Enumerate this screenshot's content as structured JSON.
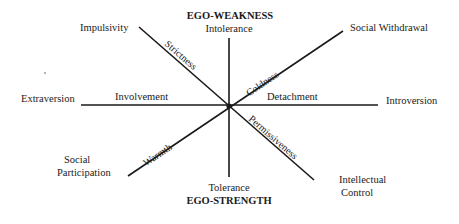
{
  "diagram": {
    "center": {
      "x": 229,
      "y": 106
    },
    "axes": [
      {
        "id": "horizontal",
        "from": [
          81,
          105
        ],
        "to": [
          378,
          105
        ],
        "left_end": "Extraversion",
        "right_end": "Introversion",
        "left_segment": "Involvement",
        "right_segment": "Detachment"
      },
      {
        "id": "vertical",
        "from": [
          229,
          38
        ],
        "to": [
          229,
          177
        ],
        "top_end": "Intolerance",
        "bottom_end": "Tolerance",
        "top_heading": "EGO-WEAKNESS",
        "bottom_heading": "EGO-STRENGTH"
      },
      {
        "id": "diag-down",
        "from": [
          139,
          27
        ],
        "to": [
          314,
          180
        ],
        "upper_end": "Impulsivity",
        "lower_end": "Intellectual Control",
        "upper_segment": "Strictness",
        "lower_segment": "Permissiveness"
      },
      {
        "id": "diag-up",
        "from": [
          128,
          176
        ],
        "to": [
          343,
          31
        ],
        "lower_end": "Social Participation",
        "upper_end": "Social Withdrawal",
        "lower_segment": "Warmth",
        "upper_segment": "Coldness"
      }
    ]
  },
  "labels": {
    "ego_weakness": "EGO-WEAKNESS",
    "intolerance": "Intolerance",
    "tolerance": "Tolerance",
    "ego_strength": "EGO-STRENGTH",
    "impulsivity": "Impulsivity",
    "social_withdrawal": "Social Withdrawal",
    "extraversion": "Extraversion",
    "introversion": "Introversion",
    "social": "Social",
    "participation": "Participation",
    "intellectual": "Intellectual",
    "control": "Control",
    "involvement": "Involvement",
    "detachment": "Detachment",
    "strictness": "Strictness",
    "coldness": "Coldness",
    "warmth": "Warmth",
    "permissiveness": "Permissiveness"
  }
}
